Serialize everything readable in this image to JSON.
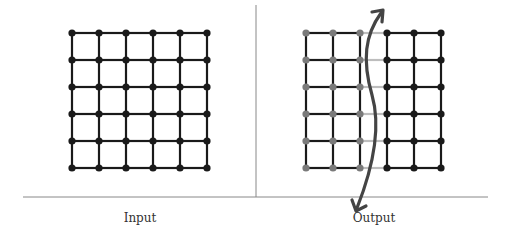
{
  "labels": {
    "input": "Input",
    "output": "Output"
  },
  "colors": {
    "edge": "#1a1a1a",
    "node_black": "#1a1a1a",
    "node_gray": "#7a7a7a",
    "cut_edge": "#bdbdbd",
    "arrow": "#444444",
    "divider": "#888888"
  },
  "grid": {
    "rows": 6,
    "cols": 6,
    "spacing": 27
  },
  "input_grid": {
    "x0": 72,
    "y0": 33
  },
  "output_grid": {
    "x0": 306,
    "y0": 33,
    "partition_col": 3
  }
}
